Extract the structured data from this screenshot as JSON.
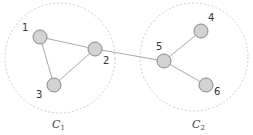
{
  "clusters": [
    {
      "id": "C1",
      "label": "C",
      "subscript": "1",
      "cx": 60,
      "cy": 58,
      "r": 55
    },
    {
      "id": "C2",
      "label": "C",
      "subscript": "2",
      "cx": 194,
      "cy": 57,
      "r": 54
    }
  ],
  "nodes": [
    {
      "id": "1",
      "label": "1",
      "x": 40,
      "y": 37,
      "lx": 22,
      "ly": 31
    },
    {
      "id": "2",
      "label": "2",
      "x": 95,
      "y": 49,
      "lx": 103,
      "ly": 64
    },
    {
      "id": "3",
      "label": "3",
      "x": 54,
      "y": 85,
      "lx": 36,
      "ly": 98
    },
    {
      "id": "4",
      "label": "4",
      "x": 201,
      "y": 31,
      "lx": 208,
      "ly": 21
    },
    {
      "id": "5",
      "label": "5",
      "x": 164,
      "y": 61,
      "lx": 156,
      "ly": 50
    },
    {
      "id": "6",
      "label": "6",
      "x": 206,
      "y": 85,
      "lx": 214,
      "ly": 95
    }
  ],
  "edges": [
    [
      "1",
      "2"
    ],
    [
      "1",
      "3"
    ],
    [
      "2",
      "3"
    ],
    [
      "2",
      "5"
    ],
    [
      "5",
      "4"
    ],
    [
      "5",
      "6"
    ]
  ],
  "colors": {
    "node_fill": "#d3d3d3",
    "node_stroke": "#888888",
    "edge": "#aaaaaa",
    "cluster_stroke": "#cccccc"
  },
  "cluster_labels": [
    {
      "text": "C",
      "sub": "1",
      "x": 52,
      "y": 128
    },
    {
      "text": "C",
      "sub": "2",
      "x": 192,
      "y": 128
    }
  ]
}
